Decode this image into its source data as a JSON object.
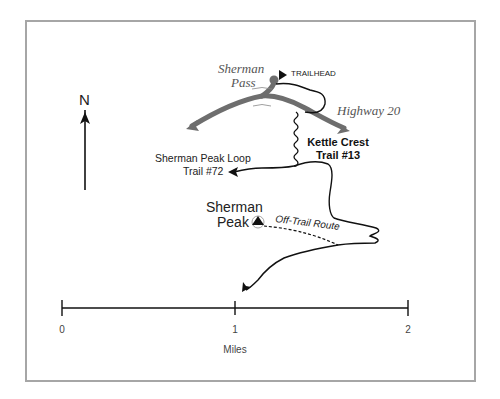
{
  "map": {
    "north_label": "N",
    "labels": {
      "sherman_pass_line1": "Sherman",
      "sherman_pass_line2": "Pass",
      "trailhead": "TRAILHEAD",
      "highway": "Highway 20",
      "kettle_crest_line1": "Kettle Crest",
      "kettle_crest_line2": "Trail #13",
      "loop_line1": "Sherman Peak Loop",
      "loop_line2": "Trail #72",
      "peak_line1": "Sherman",
      "peak_line2": "Peak",
      "off_trail": "Off-Trail Route"
    },
    "icons": [
      "north-arrow-icon",
      "trailhead-flag-icon",
      "peak-triangle-icon",
      "trail-arrow-icon"
    ],
    "colors": {
      "frame": "#a6a6a6",
      "highway": "#6e6e6e",
      "trail": "#111111",
      "text": "#222222"
    }
  },
  "scale_bar": {
    "ticks": [
      "0",
      "1",
      "2"
    ],
    "unit": "Miles"
  }
}
